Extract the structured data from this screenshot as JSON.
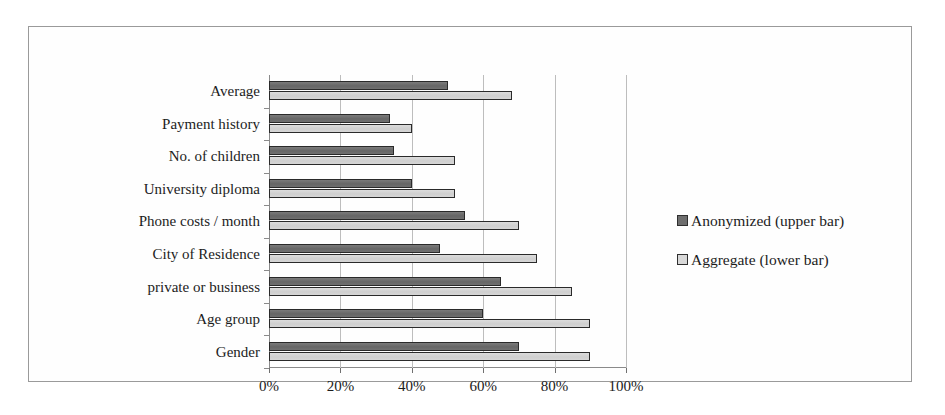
{
  "chart_data": {
    "type": "bar",
    "orientation": "horizontal",
    "title": "",
    "xlabel": "",
    "ylabel": "",
    "xlim": [
      0,
      100
    ],
    "xunit": "%",
    "grid": true,
    "legend_position": "right",
    "categories": [
      "Average",
      "Payment history",
      "No. of children",
      "University diploma",
      "Phone costs / month",
      "City of Residence",
      "private or business",
      "Age group",
      "Gender"
    ],
    "tick_labels": [
      "0%",
      "20%",
      "40%",
      "60%",
      "80%",
      "100%"
    ],
    "tick_values": [
      0,
      20,
      40,
      60,
      80,
      100
    ],
    "series": [
      {
        "name": "Anonymized (upper bar)",
        "color": "#6e6e6e",
        "values": [
          50,
          34,
          35,
          40,
          55,
          48,
          65,
          60,
          70
        ]
      },
      {
        "name": "Aggregate (lower bar)",
        "color": "#d3d3d3",
        "values": [
          68,
          40,
          52,
          52,
          70,
          75,
          85,
          90,
          90
        ]
      }
    ]
  },
  "legend": {
    "items": [
      {
        "label": "Anonymized (upper bar)",
        "swatch": "dark"
      },
      {
        "label": "Aggregate (lower bar)",
        "swatch": "light"
      }
    ]
  }
}
